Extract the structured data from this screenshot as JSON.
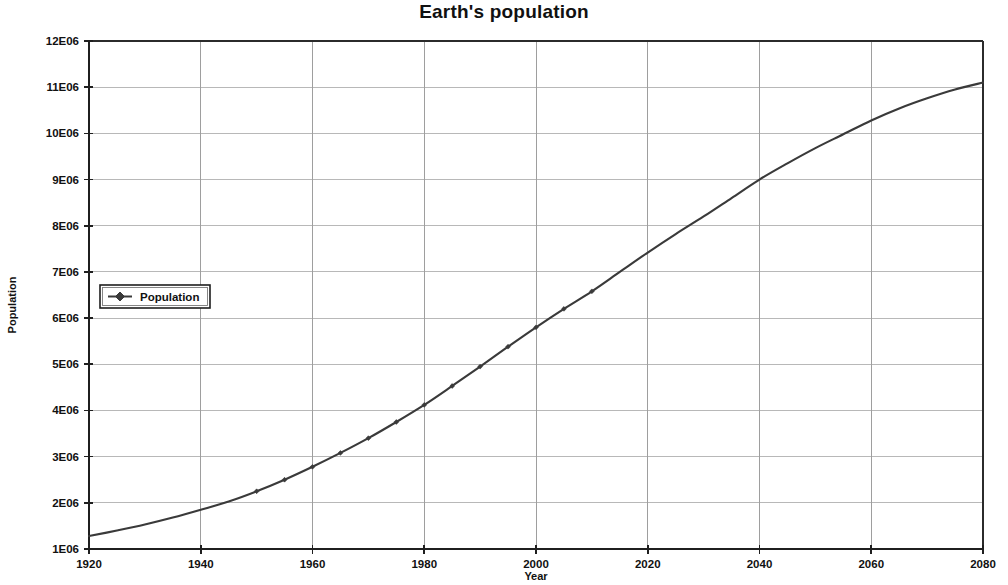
{
  "chart_data": {
    "type": "line",
    "title": "Earth's population",
    "xlabel": "Year",
    "ylabel": "Population",
    "xlim": [
      1920,
      2080
    ],
    "ylim": [
      1000000,
      12000000
    ],
    "grid": true,
    "legend_position": "inside-left",
    "x_ticks": [
      1920,
      1940,
      1960,
      1980,
      2000,
      2020,
      2040,
      2060,
      2080
    ],
    "x_tick_labels": [
      "1920",
      "1940",
      "1960",
      "1980",
      "2000",
      "2020",
      "2040",
      "2060",
      "2080"
    ],
    "y_ticks": [
      1000000,
      2000000,
      3000000,
      4000000,
      5000000,
      6000000,
      7000000,
      8000000,
      9000000,
      10000000,
      11000000,
      12000000
    ],
    "y_tick_labels": [
      "1E06",
      "2E06",
      "3E06",
      "4E06",
      "5E06",
      "6E06",
      "7E06",
      "8E06",
      "9E06",
      "10E06",
      "11E06",
      "12E06"
    ],
    "series": [
      {
        "name": "Population",
        "color": "#3a3a3a",
        "marker": "diamond",
        "x": [
          1920,
          1925,
          1930,
          1935,
          1940,
          1945,
          1950,
          1955,
          1960,
          1965,
          1970,
          1975,
          1980,
          1985,
          1990,
          1995,
          2000,
          2005,
          2010,
          2015,
          2020,
          2025,
          2030,
          2035,
          2040,
          2045,
          2050,
          2055,
          2060,
          2065,
          2070,
          2075,
          2080
        ],
        "values": [
          1280000,
          1400000,
          1530000,
          1680000,
          1850000,
          2030000,
          2250000,
          2500000,
          2780000,
          3080000,
          3400000,
          3750000,
          4120000,
          4530000,
          4950000,
          5380000,
          5800000,
          6200000,
          6580000,
          7000000,
          7420000,
          7820000,
          8200000,
          8600000,
          9000000,
          9350000,
          9680000,
          9980000,
          10280000,
          10540000,
          10760000,
          10950000,
          11100000
        ]
      }
    ]
  },
  "legend": {
    "entries": [
      {
        "label": "Population"
      }
    ]
  }
}
